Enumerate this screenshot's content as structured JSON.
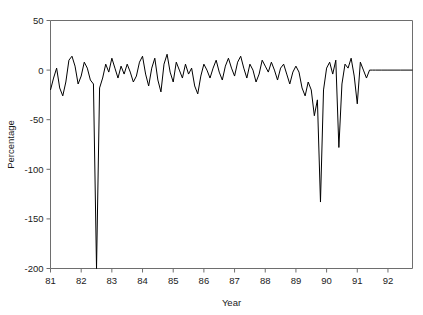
{
  "figure": {
    "background": "#ffffff",
    "line_color": "#000000",
    "axis_color": "#6e6e6e",
    "clipped_caption": ""
  },
  "chart_data": {
    "type": "line",
    "title": "",
    "xlabel": "Year",
    "ylabel": "Percentage",
    "xlim": [
      81.0,
      92.8
    ],
    "ylim": [
      -200,
      50
    ],
    "xticks": [
      81,
      82,
      83,
      84,
      85,
      86,
      87,
      88,
      89,
      90,
      91,
      92
    ],
    "xtick_labels": [
      "81",
      "82",
      "83",
      "84",
      "85",
      "86",
      "87",
      "88",
      "89",
      "90",
      "91",
      "92"
    ],
    "yticks": [
      50,
      0,
      -50,
      -100,
      -150,
      -200
    ],
    "ytick_labels": [
      "50",
      "0",
      "-50",
      "-100",
      "-150",
      "-200"
    ],
    "grid": false,
    "legend": null,
    "series": [
      {
        "name": "Percentage",
        "x": [
          81.0,
          81.1,
          81.2,
          81.3,
          81.4,
          81.5,
          81.6,
          81.7,
          81.8,
          81.9,
          82.0,
          82.1,
          82.2,
          82.3,
          82.4,
          82.5,
          82.6,
          82.7,
          82.8,
          82.9,
          83.0,
          83.1,
          83.2,
          83.3,
          83.4,
          83.5,
          83.6,
          83.7,
          83.8,
          83.9,
          84.0,
          84.1,
          84.2,
          84.3,
          84.4,
          84.5,
          84.6,
          84.7,
          84.8,
          84.9,
          85.0,
          85.1,
          85.2,
          85.3,
          85.4,
          85.5,
          85.6,
          85.7,
          85.8,
          85.9,
          86.0,
          86.1,
          86.2,
          86.3,
          86.4,
          86.5,
          86.6,
          86.7,
          86.8,
          86.9,
          87.0,
          87.1,
          87.2,
          87.3,
          87.4,
          87.5,
          87.6,
          87.7,
          87.8,
          87.9,
          88.0,
          88.1,
          88.2,
          88.3,
          88.4,
          88.5,
          88.6,
          88.7,
          88.8,
          88.9,
          89.0,
          89.1,
          89.2,
          89.3,
          89.4,
          89.5,
          89.6,
          89.7,
          89.8,
          89.9,
          90.0,
          90.1,
          90.2,
          90.3,
          90.4,
          90.5,
          90.6,
          90.7,
          90.8,
          90.9,
          91.0,
          91.1,
          91.2,
          91.3,
          91.4,
          91.5,
          91.6,
          91.8,
          92.0,
          92.4,
          92.8
        ],
        "y": [
          -20,
          -8,
          2,
          -18,
          -26,
          -12,
          10,
          14,
          4,
          -14,
          -6,
          8,
          2,
          -10,
          -14,
          -200,
          -18,
          -8,
          6,
          -2,
          12,
          2,
          -8,
          4,
          -4,
          6,
          -2,
          -12,
          -6,
          8,
          14,
          -4,
          -16,
          2,
          12,
          -10,
          -22,
          6,
          16,
          -2,
          -12,
          8,
          0,
          -8,
          6,
          -4,
          2,
          -16,
          -24,
          -6,
          6,
          0,
          -8,
          2,
          10,
          -2,
          -10,
          4,
          12,
          2,
          -6,
          8,
          14,
          2,
          -8,
          6,
          0,
          -12,
          -4,
          10,
          4,
          -2,
          8,
          0,
          -10,
          2,
          6,
          -4,
          -14,
          -2,
          4,
          -2,
          -18,
          -26,
          -12,
          -20,
          -46,
          -30,
          -133,
          -20,
          2,
          8,
          -4,
          10,
          -78,
          -14,
          6,
          2,
          12,
          -6,
          -34,
          8,
          0,
          -8,
          0,
          0,
          0,
          0,
          0,
          0,
          0
        ]
      }
    ],
    "annotations": [
      {
        "label": "deep spike to axis floor",
        "x": 82.5,
        "y": -200
      },
      {
        "label": "spike",
        "x": 89.8,
        "y": -133
      },
      {
        "label": "spike",
        "x": 90.4,
        "y": -78
      },
      {
        "label": "flat at zero after",
        "x": 91.4,
        "y": 0
      }
    ]
  }
}
